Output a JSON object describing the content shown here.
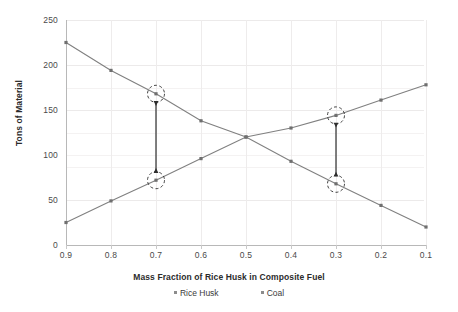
{
  "chart_data": {
    "type": "line",
    "title": "",
    "xlabel": "Mass Fraction of Rice Husk in Composite Fuel",
    "ylabel": "Tons of Material",
    "categories": [
      "0.9",
      "0.8",
      "0.7",
      "0.6",
      "0.5",
      "0.4",
      "0.3",
      "0.2",
      "0.1"
    ],
    "x": [
      0.9,
      0.8,
      0.7,
      0.6,
      0.5,
      0.4,
      0.3,
      0.2,
      0.1
    ],
    "x_axis_reversed": true,
    "xlim": [
      0.9,
      0.1
    ],
    "ylim": [
      0,
      250
    ],
    "yticks": [
      "0",
      "50",
      "100",
      "150",
      "200",
      "250"
    ],
    "ytick_values": [
      0,
      50,
      100,
      150,
      200,
      250
    ],
    "grid": "horizontal-and-vertical-faint",
    "legend_position": "bottom-center",
    "series": [
      {
        "name": "Rice Husk",
        "color": "#808080",
        "marker": "square",
        "values": [
          25,
          49,
          72,
          96,
          120,
          130,
          144,
          161,
          178
        ]
      },
      {
        "name": "Coal",
        "color": "#808080",
        "marker": "square",
        "values": [
          225,
          194,
          168,
          138,
          120,
          93,
          68,
          44,
          20
        ]
      }
    ],
    "annotations": [
      {
        "name": "gap-marker-0.7",
        "x": 0.7,
        "circles": [
          {
            "at_series": "Coal",
            "value": 168
          },
          {
            "at_series": "Rice Husk",
            "value": 72
          }
        ],
        "arrow": {
          "type": "double-headed-vertical",
          "from": 168,
          "to": 72
        }
      },
      {
        "name": "gap-marker-0.3",
        "x": 0.3,
        "circles": [
          {
            "at_series": "Rice Husk",
            "value": 144
          },
          {
            "at_series": "Coal",
            "value": 68
          }
        ],
        "arrow": {
          "type": "double-headed-vertical",
          "from": 144,
          "to": 68
        }
      }
    ]
  },
  "legend": {
    "items": [
      {
        "label": "Rice Husk",
        "color": "#8c8c8c"
      },
      {
        "label": "Coal",
        "color": "#8c8c8c"
      }
    ]
  },
  "colors": {
    "series_line": "#8a8a8a",
    "grid": "#ececec",
    "axis": "#bcbcbc",
    "text": "#3f3f3f",
    "annotation": "#2e2e2e",
    "background": "#ffffff"
  }
}
